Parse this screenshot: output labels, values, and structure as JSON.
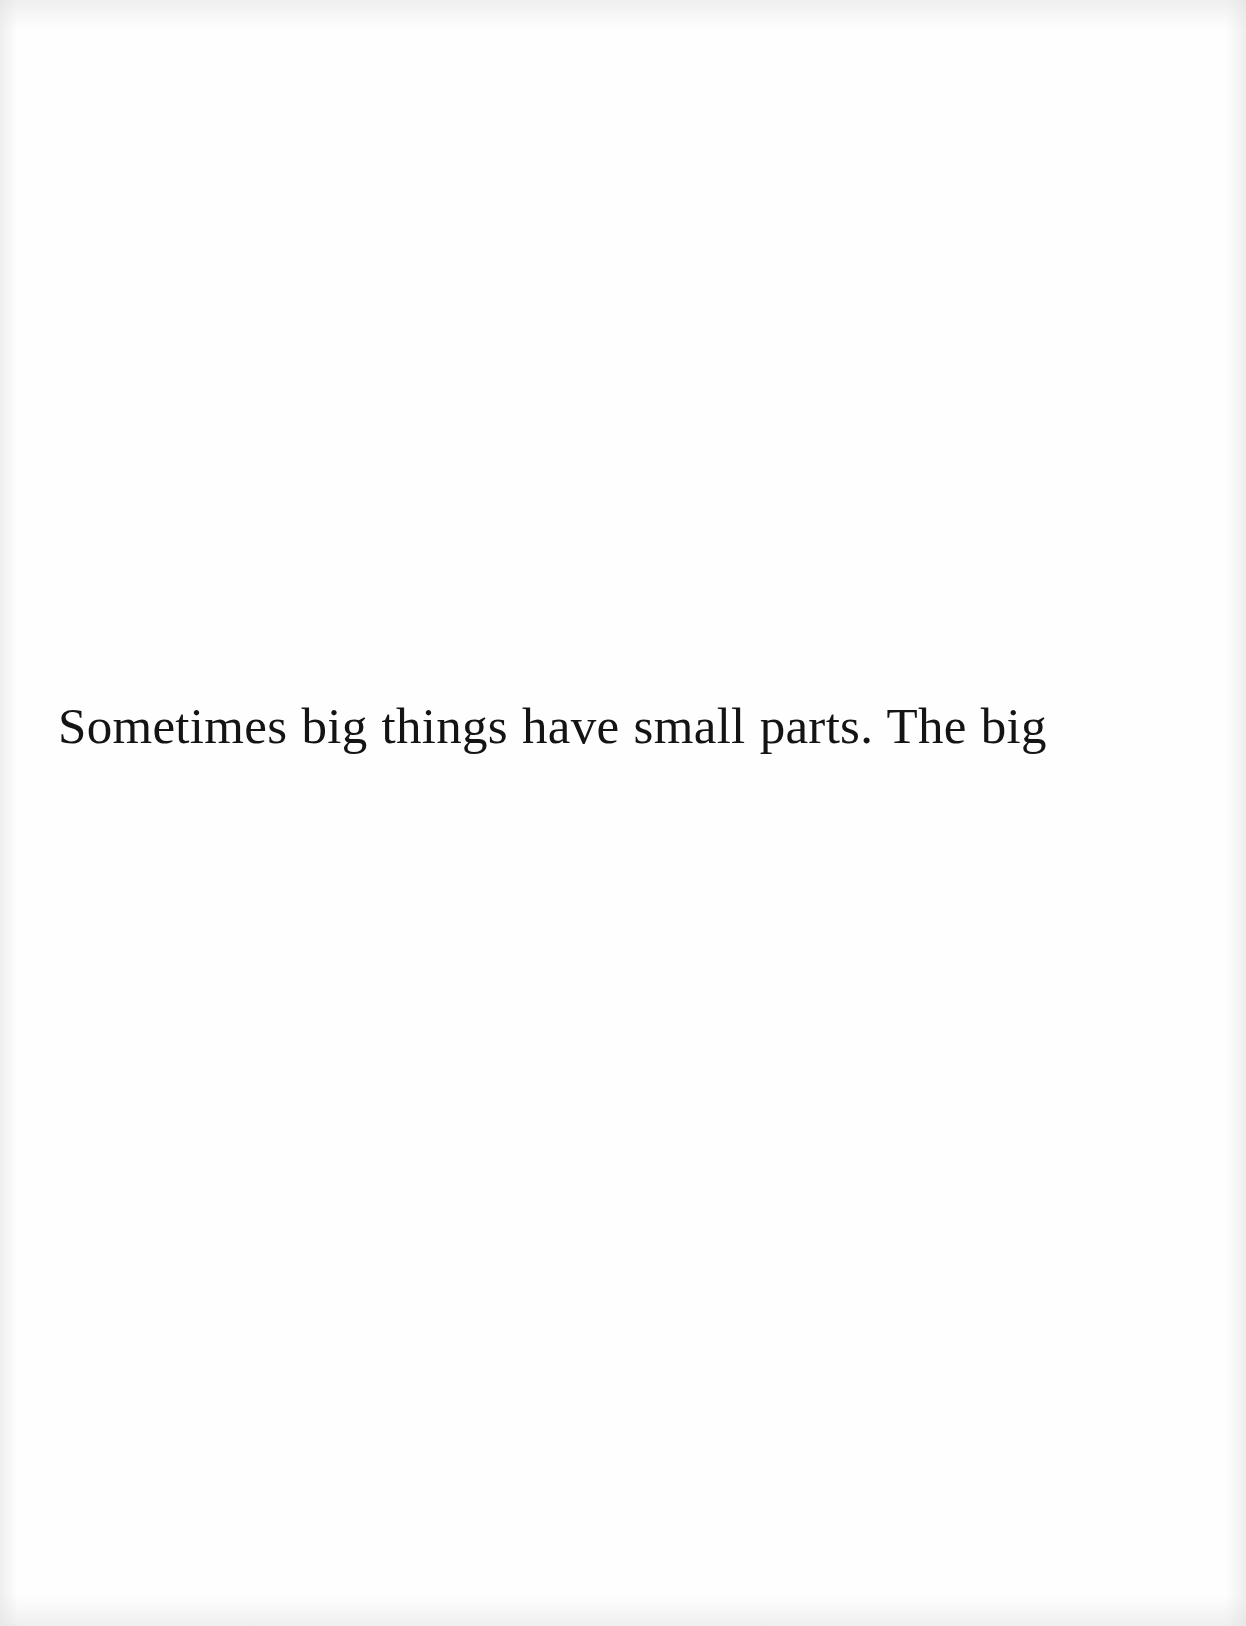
{
  "page": {
    "text_line": "Sometimes big things have small parts. The big",
    "background_color": "#fefefe",
    "text_color": "#141414"
  }
}
